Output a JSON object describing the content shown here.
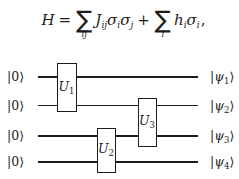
{
  "formula": {
    "H": "H",
    "eq": "=",
    "sum1_symbol": "∑",
    "sum1_sub": "ij",
    "J": "J",
    "J_sub": "ij",
    "sigma1": "σ",
    "sigma1_sub": "i",
    "sigma2": "σ",
    "sigma2_sub": "j",
    "plus": "+",
    "sum2_symbol": "∑",
    "sum2_sub": "i",
    "h": "h",
    "h_sub": "i",
    "sigma3": "σ",
    "sigma3_sub": "i",
    "comma": ","
  },
  "circuit": {
    "inputs": [
      {
        "label": "|0⟩"
      },
      {
        "label": "|0⟩"
      },
      {
        "label": "|0⟩"
      },
      {
        "label": "|0⟩"
      }
    ],
    "outputs": [
      {
        "bar": "|",
        "psi": "ψ",
        "sub": "1",
        "ket": "⟩"
      },
      {
        "bar": "|",
        "psi": "ψ",
        "sub": "2",
        "ket": "⟩"
      },
      {
        "bar": "|",
        "psi": "ψ",
        "sub": "3",
        "ket": "⟩"
      },
      {
        "bar": "|",
        "psi": "ψ",
        "sub": "4",
        "ket": "⟩"
      }
    ],
    "gates": [
      {
        "name": "U",
        "sub": "1"
      },
      {
        "name": "U",
        "sub": "2"
      },
      {
        "name": "U",
        "sub": "3"
      }
    ]
  },
  "colors": {
    "ink": "#1c1c1c",
    "background": "#ffffff"
  }
}
